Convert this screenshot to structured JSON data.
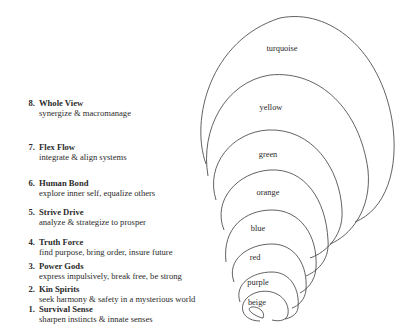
{
  "levels": [
    {
      "number": "8.",
      "name": "Whole View",
      "description": "synergize & macromanage"
    },
    {
      "number": "7.",
      "name": "Flex Flow",
      "description": "integrate & align systems"
    },
    {
      "number": "6.",
      "name": "Human Bond",
      "description": "explore inner self, equalize others"
    },
    {
      "number": "5.",
      "name": "Strive Drive",
      "description": "analyze & strategize to prosper"
    },
    {
      "number": "4.",
      "name": "Truth Force",
      "description": "find purpose, bring order, insure future"
    },
    {
      "number": "3.",
      "name": "Power Gods",
      "description": "express impulsively, break free,  be strong"
    },
    {
      "number": "2.",
      "name": "Kin Spirits",
      "description": "seek harmony & safety in a mysterious world"
    },
    {
      "number": "1.",
      "name": "Survival Sense",
      "description": "sharpen instincts & innate senses"
    }
  ],
  "rings": [
    {
      "label": "turquoise"
    },
    {
      "label": "yellow"
    },
    {
      "label": "green"
    },
    {
      "label": "orange"
    },
    {
      "label": "blue"
    },
    {
      "label": "red"
    },
    {
      "label": "purple"
    },
    {
      "label": "beige"
    }
  ],
  "colors": {
    "stroke": "#3a3a3a",
    "text": "#2a2a2a",
    "background": "#ffffff"
  }
}
